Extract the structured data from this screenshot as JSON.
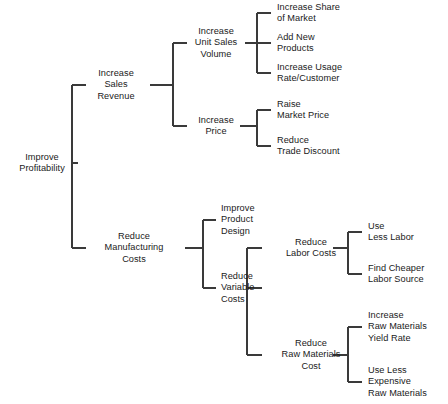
{
  "diagram": {
    "title": "Improve Profitability",
    "type": "objectives-tree",
    "line_color": "#3a3a3a",
    "text_color": "#1a1a1a",
    "background_color": "#ffffff",
    "nodes": [
      {
        "id": "root",
        "label": "Improve\nProfitability",
        "level": 0,
        "x": 42,
        "y": 163,
        "align": "center"
      },
      {
        "id": "sales_rev",
        "label": "Increase\nSales\nRevenue",
        "level": 1,
        "x": 116,
        "y": 85,
        "align": "center"
      },
      {
        "id": "mfg_costs",
        "label": "Reduce\nManufacturing\nCosts",
        "level": 1,
        "x": 134,
        "y": 248,
        "align": "center"
      },
      {
        "id": "unit_sales",
        "label": "Increase\nUnit Sales\nVolume",
        "level": 2,
        "x": 216,
        "y": 43,
        "align": "center"
      },
      {
        "id": "inc_price",
        "label": "Increase\nPrice",
        "level": 2,
        "x": 216,
        "y": 126,
        "align": "center"
      },
      {
        "id": "prod_design",
        "label": "Improve\nProduct\nDesign",
        "level": 2,
        "x": 221,
        "y": 220,
        "align": "left"
      },
      {
        "id": "var_costs",
        "label": "Reduce\nVariable\nCosts",
        "level": 2,
        "x": 221,
        "y": 288,
        "align": "left"
      },
      {
        "id": "share_market",
        "label": "Increase Share\nof Market",
        "level": 3,
        "x": 277,
        "y": 13,
        "align": "left"
      },
      {
        "id": "new_products",
        "label": "Add New\nProducts",
        "level": 3,
        "x": 277,
        "y": 43,
        "align": "left"
      },
      {
        "id": "usage_rate",
        "label": "Increase Usage\nRate/Customer",
        "level": 3,
        "x": 277,
        "y": 73,
        "align": "left"
      },
      {
        "id": "raise_price",
        "label": "Raise\nMarket Price",
        "level": 3,
        "x": 277,
        "y": 110,
        "align": "left"
      },
      {
        "id": "trade_discount",
        "label": "Reduce\nTrade Discount",
        "level": 3,
        "x": 277,
        "y": 146,
        "align": "left"
      },
      {
        "id": "labor_costs",
        "label": "Reduce\nLabor Costs",
        "level": 3,
        "x": 311,
        "y": 248,
        "align": "center"
      },
      {
        "id": "raw_mat_cost",
        "label": "Reduce\nRaw Materials\nCost",
        "level": 3,
        "x": 311,
        "y": 355,
        "align": "center"
      },
      {
        "id": "less_labor",
        "label": "Use\nLess Labor",
        "level": 4,
        "x": 368,
        "y": 232,
        "align": "left"
      },
      {
        "id": "cheaper_labor",
        "label": "Find Cheaper\nLabor Source",
        "level": 4,
        "x": 368,
        "y": 274,
        "align": "left"
      },
      {
        "id": "yield_rate",
        "label": "Increase\nRaw Materials\nYield Rate",
        "level": 4,
        "x": 368,
        "y": 327,
        "align": "left"
      },
      {
        "id": "less_expensive",
        "label": "Use Less\nExpensive\nRaw Materials",
        "level": 4,
        "x": 368,
        "y": 382,
        "align": "left"
      }
    ],
    "connectors": [
      {
        "from": "root",
        "to": [
          "sales_rev",
          "mfg_costs"
        ],
        "spine_x": 72,
        "spine_top": 85,
        "spine_bottom": 248,
        "in_y": 163,
        "in_x1": 78,
        "in_x2": 72,
        "out_x": 86
      },
      {
        "from": "sales_rev",
        "to": [
          "unit_sales",
          "inc_price"
        ],
        "spine_x": 173,
        "spine_top": 43,
        "spine_bottom": 126,
        "in_y": 85,
        "in_x1": 150,
        "in_x2": 173,
        "out_x": 187
      },
      {
        "from": "unit_sales",
        "to": [
          "share_market",
          "new_products",
          "usage_rate"
        ],
        "spine_x": 257,
        "spine_top": 13,
        "spine_bottom": 73,
        "in_y": 43,
        "in_x1": 245,
        "in_x2": 257,
        "out_x": 271
      },
      {
        "from": "inc_price",
        "to": [
          "raise_price",
          "trade_discount"
        ],
        "spine_x": 257,
        "spine_top": 110,
        "spine_bottom": 146,
        "in_y": 126,
        "in_x1": 240,
        "in_x2": 257,
        "out_x": 271
      },
      {
        "from": "mfg_costs",
        "to": [
          "prod_design",
          "var_costs"
        ],
        "spine_x": 203,
        "spine_top": 220,
        "spine_bottom": 288,
        "in_y": 248,
        "in_x1": 185,
        "in_x2": 203,
        "out_x": 216
      },
      {
        "from": "var_costs",
        "to": [
          "labor_costs",
          "raw_mat_cost"
        ],
        "spine_x": 247,
        "spine_top": 248,
        "spine_bottom": 355,
        "in_y": 288,
        "in_x1": 262,
        "in_x2": 247,
        "out_x": 262
      },
      {
        "from": "labor_costs",
        "to": [
          "less_labor",
          "cheaper_labor"
        ],
        "spine_x": 348,
        "spine_top": 232,
        "spine_bottom": 274,
        "in_y": 248,
        "in_x1": 333,
        "in_x2": 348,
        "out_x": 362
      },
      {
        "from": "raw_mat_cost",
        "to": [
          "yield_rate",
          "less_expensive"
        ],
        "spine_x": 348,
        "spine_top": 327,
        "spine_bottom": 382,
        "in_y": 355,
        "in_x1": 333,
        "in_x2": 348,
        "out_x": 362
      }
    ]
  }
}
